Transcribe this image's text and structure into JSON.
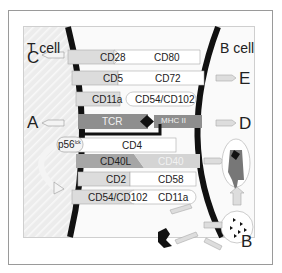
{
  "cells": {
    "left": "T cell",
    "right": "B cell"
  },
  "markers": {
    "A": "A",
    "B": "B",
    "C": "C",
    "D": "D",
    "E": "E"
  },
  "kinase": {
    "name": "p56",
    "sup": "lck"
  },
  "pairs": [
    {
      "t": "CD28",
      "b": "CD80"
    },
    {
      "t": "CD5",
      "b": "CD72"
    },
    {
      "t": "CD11a",
      "b": "CD54/CD102"
    },
    {
      "t": "TCR",
      "b": "MHC II"
    },
    {
      "t": "CD4",
      "b": ""
    },
    {
      "t": "CD40L",
      "b": "CD40"
    },
    {
      "t": "CD2",
      "b": "CD58"
    },
    {
      "t": "CD54/CD102",
      "b": "CD11a"
    }
  ],
  "colors": {
    "membrane": "#111111",
    "tcr": "#8e8e8e",
    "cd40l": "#a6a6a6",
    "light": "#dedede",
    "white": "#ffffff"
  }
}
